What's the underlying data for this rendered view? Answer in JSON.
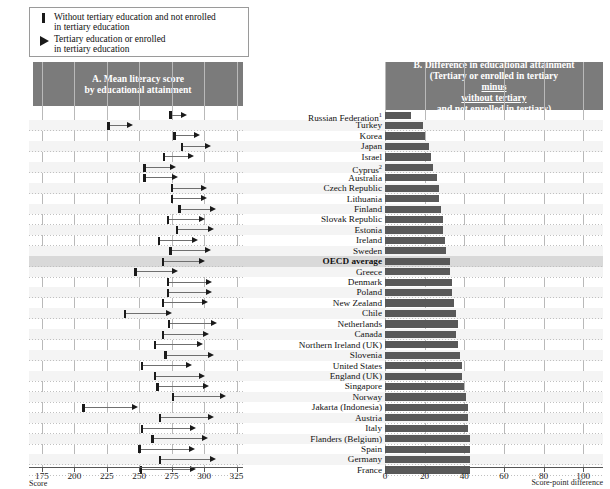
{
  "legend": {
    "items": [
      {
        "icon": "thick-bar-glyph",
        "label_line1": "Without tertiary education and not enrolled",
        "label_line2": "in tertiary education"
      },
      {
        "icon": "right-triangle-glyph",
        "label_line1": "Tertiary education or enrolled",
        "label_line2": "in tertiary education"
      }
    ]
  },
  "panelA": {
    "title_line1": "A. Mean literacy score",
    "title_line2": "by educational attainment",
    "axis": {
      "label": "Score",
      "ticks": [
        175,
        200,
        225,
        250,
        275,
        300,
        325
      ],
      "min": 165,
      "max": 330
    }
  },
  "panelB": {
    "title_line1": "B. Difference in educational attainment",
    "title_line2": "(Tertiary or enrolled in tertiary",
    "title_line3": "minus",
    "title_line4": "without tertiary",
    "title_line5": "and not enrolled in tertiary)",
    "axis": {
      "label": "Score-point difference",
      "ticks": [
        0,
        20,
        40,
        60,
        80,
        100
      ],
      "min": 0,
      "max": 110
    }
  },
  "chart_data": {
    "type": "bar",
    "xlabel": "Score / Score-point difference",
    "ylabel": "",
    "series_names": [
      "Without tertiary education and not enrolled in tertiary education",
      "Tertiary education or enrolled in tertiary education",
      "Difference"
    ],
    "categories": [
      "Russian Federation¹",
      "Turkey",
      "Korea",
      "Japan",
      "Israel",
      "Cyprus²",
      "Australia",
      "Czech Republic",
      "Lithuania",
      "Finland",
      "Slovak Republic",
      "Estonia",
      "Ireland",
      "Sweden",
      "OECD average",
      "Greece",
      "Denmark",
      "Poland",
      "New Zealand",
      "Chile",
      "Netherlands",
      "Canada",
      "Northern Ireland (UK)",
      "Slovenia",
      "United States",
      "England (UK)",
      "Singapore",
      "Norway",
      "Jakarta (Indonesia)",
      "Austria",
      "Italy",
      "Flanders (Belgium)",
      "Spain",
      "Germany",
      "France"
    ],
    "without_tertiary": [
      274,
      226,
      277,
      283,
      269,
      254,
      254,
      275,
      275,
      281,
      272,
      279,
      265,
      274,
      268,
      247,
      272,
      272,
      268,
      239,
      273,
      268,
      262,
      270,
      252,
      262,
      264,
      276,
      207,
      266,
      252,
      260,
      250,
      266,
      251
    ],
    "with_tertiary": [
      287,
      245,
      297,
      305,
      292,
      278,
      280,
      302,
      302,
      309,
      301,
      308,
      295,
      305,
      301,
      280,
      306,
      306,
      303,
      275,
      310,
      304,
      299,
      308,
      291,
      301,
      304,
      317,
      249,
      308,
      294,
      303,
      293,
      309,
      294
    ],
    "difference": [
      13,
      19,
      20,
      22,
      23,
      24,
      26,
      27,
      27,
      28,
      29,
      29,
      30,
      31,
      33,
      33,
      34,
      34,
      35,
      36,
      37,
      36,
      37,
      38,
      39,
      39,
      40,
      41,
      42,
      42,
      42,
      43,
      43,
      43,
      43
    ],
    "highlight_row": "OECD average",
    "grid": true,
    "legend_position": "top-left"
  },
  "colors": {
    "header_bg": "#7b7b7b",
    "bar_fill": "#595959",
    "marker": "#1a1a1a",
    "highlight": "#d9d9d9",
    "gridline": "#c0c0c0"
  }
}
